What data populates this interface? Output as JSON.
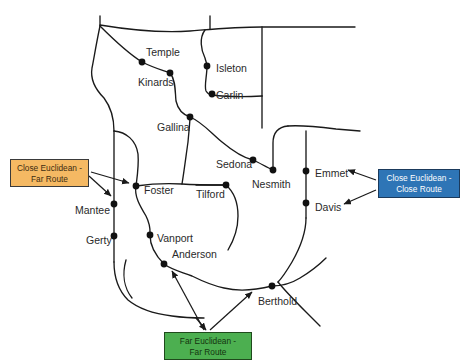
{
  "figure": {
    "stroke_color": "#1a1a1a",
    "node_color": "#111111",
    "background": "#ffffff"
  },
  "cities": [
    {
      "name": "Temple",
      "label_x": 146,
      "label_y": 47,
      "dot_x": 142,
      "dot_y": 62
    },
    {
      "name": "Kinards",
      "label_x": 138,
      "label_y": 77,
      "dot_x": 170,
      "dot_y": 73
    },
    {
      "name": "Isleton",
      "label_x": 216,
      "label_y": 63,
      "dot_x": 207,
      "dot_y": 66
    },
    {
      "name": "Carlin",
      "label_x": 216,
      "label_y": 90,
      "dot_x": 212,
      "dot_y": 94
    },
    {
      "name": "Gallina",
      "label_x": 157,
      "label_y": 122,
      "dot_x": 190,
      "dot_y": 117
    },
    {
      "name": "Sedona",
      "label_x": 216,
      "label_y": 159,
      "dot_x": 253,
      "dot_y": 160
    },
    {
      "name": "Nesmith",
      "label_x": 252,
      "label_y": 179,
      "dot_x": 273,
      "dot_y": 170
    },
    {
      "name": "Emmet",
      "label_x": 315,
      "label_y": 168,
      "dot_x": 306,
      "dot_y": 171
    },
    {
      "name": "Davis",
      "label_x": 315,
      "label_y": 202,
      "dot_x": 306,
      "dot_y": 203
    },
    {
      "name": "Tilford",
      "label_x": 196,
      "label_y": 189,
      "dot_x": 226,
      "dot_y": 185
    },
    {
      "name": "Foster",
      "label_x": 144,
      "label_y": 185,
      "dot_x": 136,
      "dot_y": 186
    },
    {
      "name": "Mantee",
      "label_x": 75,
      "label_y": 205,
      "dot_x": 114,
      "dot_y": 204
    },
    {
      "name": "Gerty",
      "label_x": 86,
      "label_y": 235,
      "dot_x": 114,
      "dot_y": 236
    },
    {
      "name": "Vanport",
      "label_x": 157,
      "label_y": 233,
      "dot_x": 150,
      "dot_y": 235
    },
    {
      "name": "Anderson",
      "label_x": 172,
      "label_y": 249,
      "dot_x": 164,
      "dot_y": 264
    },
    {
      "name": "Berthold",
      "label_x": 258,
      "label_y": 296,
      "dot_x": 272,
      "dot_y": 286
    }
  ],
  "callouts": [
    {
      "id": "close-euclidean-far-route",
      "text": "Close Euclidean -\nFar Route",
      "color": "#f5b963",
      "targets": [
        "Foster",
        "Mantee"
      ]
    },
    {
      "id": "close-euclidean-close-route",
      "text": "Close Euclidean -\nClose Route",
      "color": "#2e75b6",
      "targets": [
        "Emmet",
        "Davis"
      ]
    },
    {
      "id": "far-euclidean-far-route",
      "text": "Far Euclidean -\nFar Route",
      "color": "#4caf50",
      "targets": [
        "Anderson",
        "Berthold"
      ]
    }
  ],
  "roads": {
    "description": "Road network of curved and straight road segments connecting the cities",
    "segment_count": 18
  }
}
